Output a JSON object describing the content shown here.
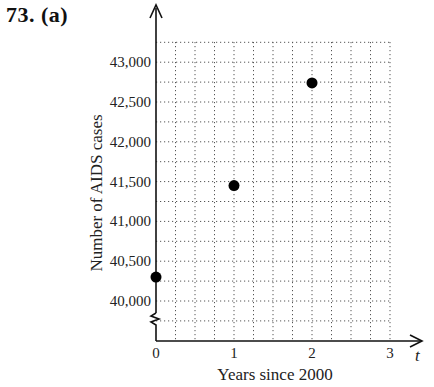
{
  "problem": {
    "label": "73.  (a)"
  },
  "chart_data": {
    "type": "scatter",
    "title": "",
    "xlabel": "Years since 2000",
    "ylabel": "Number of AIDS cases",
    "x_variable": "t",
    "x_ticks": [
      "0",
      "1",
      "2",
      "3"
    ],
    "y_ticks": [
      "40,000",
      "40,500",
      "41,000",
      "41,500",
      "42,000",
      "42,500",
      "43,000"
    ],
    "xlim": [
      0,
      3
    ],
    "ylim": [
      39500,
      43250
    ],
    "y_axis_break": true,
    "grid": true,
    "grid_style": "dotted",
    "x_grid_step": 0.25,
    "y_grid_step": 250,
    "legend": null,
    "points": [
      {
        "x": 0,
        "y": 40300
      },
      {
        "x": 1,
        "y": 41450
      },
      {
        "x": 2,
        "y": 42740
      }
    ],
    "colors": {
      "points": "#000000",
      "axes": "#111111",
      "grid": "#555555"
    }
  }
}
